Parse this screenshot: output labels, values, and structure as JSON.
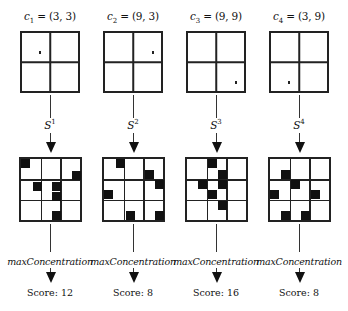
{
  "diagram": {
    "columns": [
      {
        "centroid_var": "c",
        "centroid_index": "1",
        "centroid_value": "= (3, 3)",
        "strategy_var": "S",
        "strategy_index": "1",
        "function": "maxConcentration",
        "score_text": "Score: 12",
        "score": 12,
        "top_dot": {
          "x": 17,
          "y": 18
        },
        "blocks": [
          {
            "x": 0,
            "y": 0
          },
          {
            "x": 51,
            "y": 12
          },
          {
            "x": 12,
            "y": 23
          },
          {
            "x": 31,
            "y": 23
          },
          {
            "x": 31,
            "y": 33
          },
          {
            "x": 31,
            "y": 52
          }
        ]
      },
      {
        "centroid_var": "c",
        "centroid_index": "2",
        "centroid_value": "= (9, 3)",
        "strategy_var": "S",
        "strategy_index": "2",
        "function": "maxConcentration",
        "score_text": "Score: 8",
        "score": 8,
        "top_dot": {
          "x": 47,
          "y": 18
        },
        "blocks": [
          {
            "x": 12,
            "y": 0
          },
          {
            "x": 41,
            "y": 11
          },
          {
            "x": 51,
            "y": 21
          },
          {
            "x": 0,
            "y": 31
          },
          {
            "x": 22,
            "y": 52
          },
          {
            "x": 51,
            "y": 52
          }
        ]
      },
      {
        "centroid_var": "c",
        "centroid_index": "3",
        "centroid_value": "= (9, 9)",
        "strategy_var": "S",
        "strategy_index": "3",
        "function": "maxConcentration",
        "score_text": "Score: 16",
        "score": 16,
        "top_dot": {
          "x": 47,
          "y": 48
        },
        "blocks": [
          {
            "x": 21,
            "y": 0
          },
          {
            "x": 31,
            "y": 11
          },
          {
            "x": 11,
            "y": 21
          },
          {
            "x": 31,
            "y": 21
          },
          {
            "x": 21,
            "y": 31
          },
          {
            "x": 31,
            "y": 42
          }
        ]
      },
      {
        "centroid_var": "c",
        "centroid_index": "4",
        "centroid_value": "= (3, 9)",
        "strategy_var": "S",
        "strategy_index": "4",
        "function": "maxConcentration",
        "score_text": "Score: 8",
        "score": 8,
        "top_dot": {
          "x": 17,
          "y": 48
        },
        "blocks": [
          {
            "x": 11,
            "y": 11
          },
          {
            "x": 21,
            "y": 21
          },
          {
            "x": 0,
            "y": 31
          },
          {
            "x": 41,
            "y": 31
          },
          {
            "x": 11,
            "y": 52
          },
          {
            "x": 31,
            "y": 52
          }
        ]
      }
    ]
  },
  "colors": {
    "ink": "#111111",
    "background": "#ffffff"
  }
}
